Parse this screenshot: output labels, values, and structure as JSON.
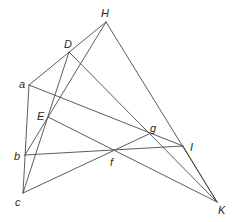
{
  "diagram": {
    "type": "geometric-construction",
    "points": [
      {
        "id": "H",
        "label": "H",
        "x": 106,
        "y": 22,
        "lx": 101,
        "ly": 17
      },
      {
        "id": "D",
        "label": "D",
        "x": 69,
        "y": 52,
        "lx": 64,
        "ly": 48
      },
      {
        "id": "a",
        "label": "a",
        "x": 29,
        "y": 85,
        "lx": 19,
        "ly": 88
      },
      {
        "id": "E",
        "label": "E",
        "x": 48,
        "y": 117,
        "lx": 37,
        "ly": 120
      },
      {
        "id": "b",
        "label": "b",
        "x": 25,
        "y": 155,
        "lx": 14,
        "ly": 160
      },
      {
        "id": "c",
        "label": "c",
        "x": 23,
        "y": 193,
        "lx": 15,
        "ly": 206
      },
      {
        "id": "f",
        "label": "f",
        "x": 113,
        "y": 152,
        "lx": 110,
        "ly": 166
      },
      {
        "id": "g",
        "label": "g",
        "x": 149,
        "y": 134,
        "lx": 150,
        "ly": 132
      },
      {
        "id": "I",
        "label": "I",
        "x": 183,
        "y": 146,
        "lx": 190,
        "ly": 151
      },
      {
        "id": "K",
        "label": "K",
        "x": 217,
        "y": 202,
        "lx": 218,
        "ly": 214
      }
    ],
    "segments": [
      [
        "H",
        "a"
      ],
      [
        "H",
        "K"
      ],
      [
        "H",
        "b"
      ],
      [
        "D",
        "c"
      ],
      [
        "D",
        "K"
      ],
      [
        "a",
        "c"
      ],
      [
        "a",
        "I"
      ],
      [
        "E",
        "K"
      ],
      [
        "b",
        "I"
      ],
      [
        "c",
        "g"
      ],
      [
        "I",
        "K"
      ]
    ]
  }
}
